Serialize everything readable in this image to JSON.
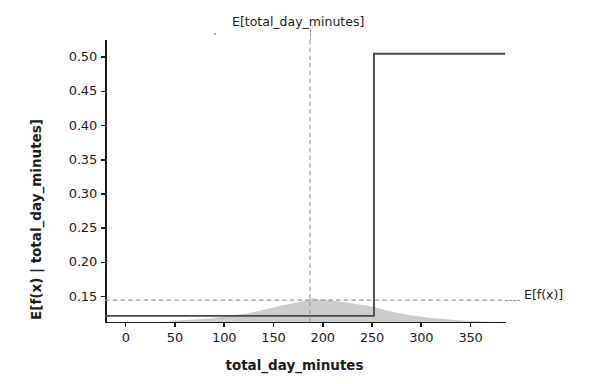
{
  "chart_data": {
    "type": "line",
    "title": "",
    "xlabel": "total_day_minutes",
    "ylabel": "E[f(x) | total_day_minutes]",
    "xlim": [
      -21,
      385
    ],
    "ylim": [
      0.113,
      0.525
    ],
    "xticks": [
      0,
      50,
      100,
      150,
      200,
      250,
      300,
      350
    ],
    "xticklabels": [
      "0",
      "50",
      "100",
      "150",
      "200",
      "250",
      "300",
      "350"
    ],
    "yticks": [
      0.15,
      0.2,
      0.25,
      0.3,
      0.35,
      0.4,
      0.45,
      0.5
    ],
    "yticklabels": [
      "0.15",
      "0.20",
      "0.25",
      "0.30",
      "0.35",
      "0.40",
      "0.45",
      "0.50"
    ],
    "grid": false,
    "legend": "none",
    "line_color": "#4a4a4a",
    "dash_color": "#999999",
    "hist_color": "#cccccc",
    "series": [
      {
        "name": "E[f(x) | total_day_minutes]",
        "type": "step",
        "x": [
          -21,
          252,
          252,
          385
        ],
        "values": [
          0.122,
          0.122,
          0.505,
          0.505
        ]
      }
    ],
    "annotations": [
      {
        "name": "expected-feature-value",
        "label": "E[total_day_minutes]",
        "orientation": "vertical",
        "x": 187,
        "style": "dashed"
      },
      {
        "name": "expected-model-output",
        "label": "E[f(x)]",
        "orientation": "horizontal",
        "y": 0.145,
        "style": "dashed"
      }
    ],
    "density": {
      "name": "feature-distribution",
      "type": "area",
      "color": "#cccccc",
      "x": [
        -21,
        0,
        20,
        40,
        55,
        70,
        85,
        100,
        112,
        124,
        136,
        148,
        158,
        168,
        176,
        184,
        190,
        196,
        202,
        208,
        216,
        224,
        232,
        240,
        248,
        256,
        264,
        274,
        286,
        300,
        316,
        334,
        352,
        368,
        385
      ],
      "values": [
        0.0,
        0.0,
        0.0,
        0.0,
        0.001,
        0.0015,
        0.002,
        0.003,
        0.004,
        0.005,
        0.0065,
        0.008,
        0.0095,
        0.0105,
        0.0115,
        0.0125,
        0.0138,
        0.013,
        0.0128,
        0.0125,
        0.0118,
        0.0112,
        0.0105,
        0.0098,
        0.009,
        0.008,
        0.0068,
        0.0055,
        0.0042,
        0.003,
        0.002,
        0.0012,
        0.0006,
        0.0002,
        0.0
      ]
    }
  },
  "axes": {
    "ylabel": "E[f(x) | total_day_minutes]",
    "xlabel": "total_day_minutes"
  },
  "labels": {
    "expected_feature": "E[total_day_minutes]",
    "expected_output": "E[f(x)]"
  }
}
